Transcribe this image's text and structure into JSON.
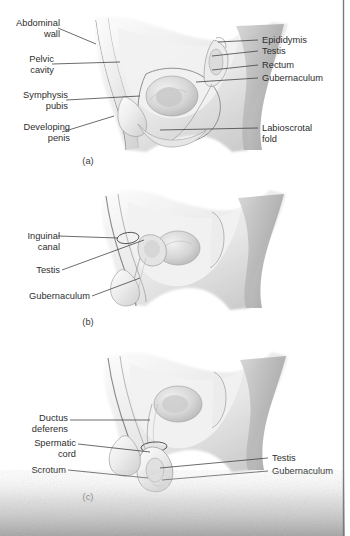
{
  "figure": {
    "panels": [
      {
        "id": "a",
        "caption": "(a)",
        "labels_left": [
          {
            "name": "abdominal-wall",
            "line1": "Abdominal",
            "line2": "wall"
          },
          {
            "name": "pelvic-cavity",
            "line1": "Pelvic",
            "line2": "cavity"
          },
          {
            "name": "symphysis-pubis",
            "line1": "Symphysis",
            "line2": "pubis"
          },
          {
            "name": "developing-penis",
            "line1": "Developing",
            "line2": "penis"
          }
        ],
        "labels_right": [
          {
            "name": "epididymis",
            "line1": "Epididymis",
            "line2": ""
          },
          {
            "name": "testis",
            "line1": "Testis",
            "line2": ""
          },
          {
            "name": "rectum",
            "line1": "Rectum",
            "line2": ""
          },
          {
            "name": "gubernaculum",
            "line1": "Gubernaculum",
            "line2": ""
          },
          {
            "name": "labioscrotal-fold",
            "line1": "Labioscrotal",
            "line2": "fold"
          }
        ]
      },
      {
        "id": "b",
        "caption": "(b)",
        "labels_left": [
          {
            "name": "inguinal-canal",
            "line1": "Inguinal",
            "line2": "canal"
          },
          {
            "name": "testis",
            "line1": "Testis",
            "line2": ""
          },
          {
            "name": "gubernaculum",
            "line1": "Gubernaculum",
            "line2": ""
          }
        ],
        "labels_right": []
      },
      {
        "id": "c",
        "caption": "(c)",
        "labels_left": [
          {
            "name": "ductus-deferens",
            "line1": "Ductus",
            "line2": "deferens"
          },
          {
            "name": "spermatic-cord",
            "line1": "Spermatic",
            "line2": "cord"
          },
          {
            "name": "scrotum",
            "line1": "Scrotum",
            "line2": ""
          }
        ],
        "labels_right": [
          {
            "name": "testis",
            "line1": "Testis",
            "line2": ""
          },
          {
            "name": "gubernaculum",
            "line1": "Gubernaculum",
            "line2": ""
          }
        ]
      }
    ],
    "colors": {
      "label_text": "#2e2e2e",
      "leader_line": "#3b3b3b",
      "outline": "#9a9a9a",
      "tissue_light": "#f4f4f4",
      "tissue_mid": "#d8d8d8",
      "tissue_dark": "#b0b0b0",
      "background": "#ffffff",
      "scan_noise": "#b9b9b9"
    }
  }
}
